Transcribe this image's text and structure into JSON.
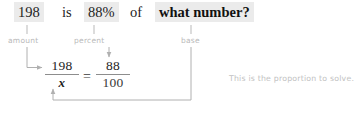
{
  "sentence": {
    "amount_value": "198",
    "verb": "is",
    "percent_value": "88%",
    "preposition": "of",
    "base_value": "what number?"
  },
  "labels": {
    "amount": "amount",
    "percent": "percent",
    "base": "base"
  },
  "proportion": {
    "left_numerator": "198",
    "left_denominator": "x",
    "equals": "=",
    "right_numerator": "88",
    "right_denominator": "100"
  },
  "note": {
    "text": "This is the proportion to solve."
  },
  "colors": {
    "ink": "#1d1d1d",
    "highlight": "#ebebeb",
    "label_gray": "#b9b9b9",
    "note_gray": "#c2c2c2",
    "wire_gray": "#b0b0b0",
    "rule_gray": "#8d8d8d"
  }
}
